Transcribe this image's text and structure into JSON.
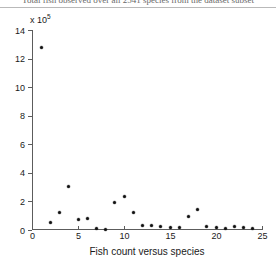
{
  "document": {
    "clipped_header_text": "Total fish observed over all 2541 species from the dataset subset"
  },
  "chart_data": {
    "type": "scatter",
    "title": "",
    "xlabel": "Fish count versus species",
    "ylabel": "",
    "y_axis_multiplier_text": "x 10",
    "y_axis_multiplier_exponent": "5",
    "xlim": [
      0,
      25
    ],
    "ylim": [
      0,
      14
    ],
    "xticks": [
      0,
      5,
      10,
      15,
      20,
      25
    ],
    "xtick_labels": [
      "0",
      "5",
      "10",
      "15",
      "20",
      "25"
    ],
    "yticks": [
      0,
      2,
      4,
      6,
      8,
      10,
      12,
      14
    ],
    "ytick_labels": [
      "0",
      "2",
      "4",
      "6",
      "8",
      "10",
      "12",
      "14"
    ],
    "grid": false,
    "legend": null,
    "marker": "dot",
    "marker_color": "#111111",
    "x": [
      1,
      2,
      3,
      4,
      5,
      6,
      7,
      8,
      9,
      10,
      11,
      12,
      13,
      14,
      15,
      16,
      17,
      18,
      19,
      20,
      21,
      22,
      23,
      24
    ],
    "y": [
      12.75,
      0.55,
      1.25,
      3.05,
      0.75,
      0.8,
      0.1,
      0.05,
      1.9,
      2.35,
      1.2,
      0.35,
      0.3,
      0.22,
      0.2,
      0.2,
      0.95,
      1.45,
      0.28,
      0.2,
      0.1,
      0.25,
      0.15,
      0.12
    ],
    "points": [
      {
        "x": 1,
        "y": 12.75
      },
      {
        "x": 2,
        "y": 0.55
      },
      {
        "x": 3,
        "y": 1.25
      },
      {
        "x": 4,
        "y": 3.05
      },
      {
        "x": 5,
        "y": 0.75
      },
      {
        "x": 6,
        "y": 0.8
      },
      {
        "x": 7,
        "y": 0.1
      },
      {
        "x": 8,
        "y": 0.05
      },
      {
        "x": 9,
        "y": 1.9
      },
      {
        "x": 10,
        "y": 2.35
      },
      {
        "x": 11,
        "y": 1.2
      },
      {
        "x": 12,
        "y": 0.35
      },
      {
        "x": 13,
        "y": 0.3
      },
      {
        "x": 14,
        "y": 0.22
      },
      {
        "x": 15,
        "y": 0.2
      },
      {
        "x": 16,
        "y": 0.2
      },
      {
        "x": 17,
        "y": 0.95
      },
      {
        "x": 18,
        "y": 1.45
      },
      {
        "x": 19,
        "y": 0.28
      },
      {
        "x": 20,
        "y": 0.2
      },
      {
        "x": 21,
        "y": 0.1
      },
      {
        "x": 22,
        "y": 0.25
      },
      {
        "x": 23,
        "y": 0.15
      },
      {
        "x": 24,
        "y": 0.12
      }
    ]
  },
  "colors": {
    "axis": "#5c5c5c",
    "marker": "#111111",
    "text": "#1a1a1a",
    "background": "#ffffff"
  }
}
